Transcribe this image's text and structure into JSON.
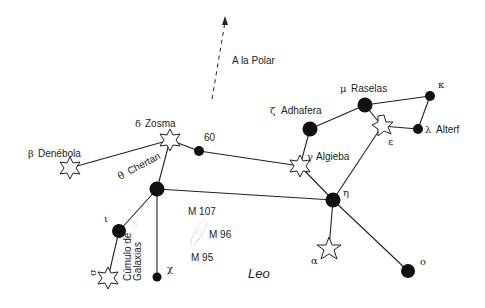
{
  "diagram": {
    "title": "Leo",
    "pointer": {
      "label": "A la Polar"
    },
    "stars": [
      {
        "id": "denebola",
        "greek": "β",
        "name": "Denébola",
        "shape": "star"
      },
      {
        "id": "zosma",
        "greek": "δ",
        "name": "Zosma",
        "shape": "star"
      },
      {
        "id": "s60",
        "greek": "",
        "name": "60",
        "shape": "dot"
      },
      {
        "id": "chertan",
        "greek": "θ",
        "name": "Chertan",
        "shape": "dot"
      },
      {
        "id": "adhafera",
        "greek": "ζ",
        "name": "Adhafera",
        "shape": "dot"
      },
      {
        "id": "rasalas",
        "greek": "μ",
        "name": "Raselas",
        "shape": "dot"
      },
      {
        "id": "kappa",
        "greek": "κ",
        "name": "",
        "shape": "dot"
      },
      {
        "id": "alterf",
        "greek": "λ",
        "name": "Alterf",
        "shape": "dot"
      },
      {
        "id": "epsilon",
        "greek": "ε",
        "name": "",
        "shape": "star"
      },
      {
        "id": "algieba",
        "greek": "γ",
        "name": "Algieba",
        "shape": "star"
      },
      {
        "id": "eta",
        "greek": "η",
        "name": "",
        "shape": "dot"
      },
      {
        "id": "regulus",
        "greek": "α",
        "name": "",
        "shape": "star"
      },
      {
        "id": "omicron",
        "greek": "ο",
        "name": "",
        "shape": "dot"
      },
      {
        "id": "iota",
        "greek": "ι",
        "name": "",
        "shape": "dot"
      },
      {
        "id": "sigma",
        "greek": "σ",
        "name": "",
        "shape": "star"
      },
      {
        "id": "chi",
        "greek": "χ",
        "name": "",
        "shape": "dot"
      }
    ],
    "galaxies": [
      {
        "label": "M 107"
      },
      {
        "label": "M 96"
      },
      {
        "label": "M 95"
      }
    ],
    "cluster": {
      "line1": "Cúmulo de",
      "line2": "Galaxias"
    }
  }
}
